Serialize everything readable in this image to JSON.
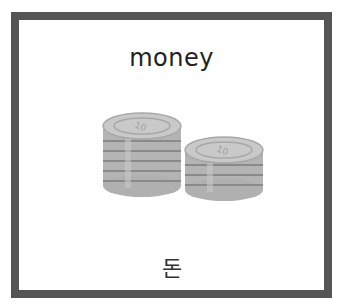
{
  "card": {
    "english_word": "money",
    "korean_word": "돈",
    "image": {
      "icon": "coin-stacks-icon",
      "left_stack_coins": 6,
      "right_stack_coins": 4,
      "coin_label": "10"
    },
    "colors": {
      "border": "#555555",
      "background": "#ffffff",
      "coin_face": "#c9c9c9",
      "coin_edge": "#a8a8a8",
      "coin_groove": "#8a8a8a"
    }
  }
}
